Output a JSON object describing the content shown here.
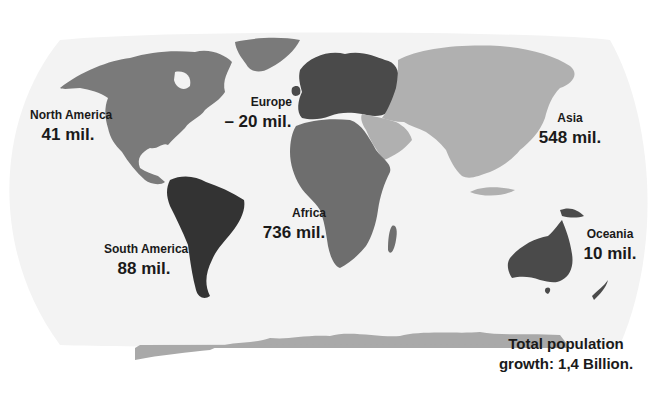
{
  "map": {
    "type": "world population growth by continent",
    "projection": "oval world map",
    "colors": {
      "ocean": "#f2f2f2",
      "background": "#ffffff",
      "north_america": "#7a7a7a",
      "south_america": "#333333",
      "europe": "#4a4a4a",
      "africa": "#6e6e6e",
      "asia": "#b0b0b0",
      "oceania": "#4a4a4a",
      "antarctica": "#a8a8a8",
      "label_text": "#1a1a1a"
    }
  },
  "regions": [
    {
      "name": "North America",
      "value": "41 mil."
    },
    {
      "name": "Europe",
      "value": "– 20 mil."
    },
    {
      "name": "Asia",
      "value": "548 mil."
    },
    {
      "name": "Africa",
      "value": "736 mil."
    },
    {
      "name": "South America",
      "value": "88 mil."
    },
    {
      "name": "Oceania",
      "value": "10 mil."
    }
  ],
  "total": {
    "line1": "Total population",
    "line2": "growth: 1,4 Billion."
  }
}
